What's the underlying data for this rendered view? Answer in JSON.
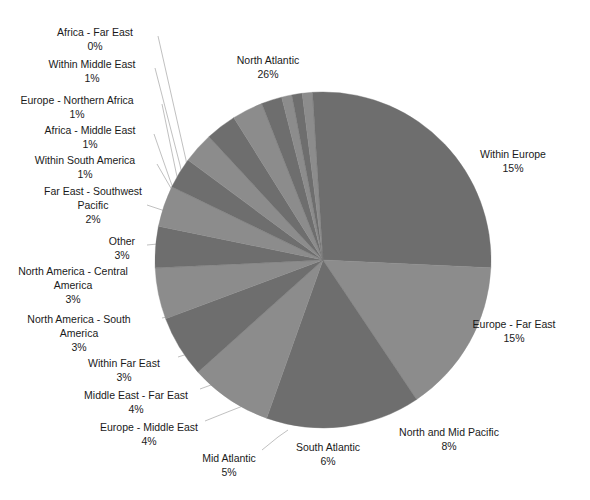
{
  "chart_data": {
    "type": "pie",
    "title": "",
    "subtitle": "",
    "xlabel": "",
    "ylabel": "",
    "grid": false,
    "legend_position": "none",
    "label_format": "name + percent",
    "start_angle_deg": 0,
    "direction": "clockwise",
    "center": {
      "x": 323,
      "y": 260
    },
    "radius": 168,
    "colors": {
      "dark_slice": "#6e6e6e",
      "light_slice": "#8c8c8c",
      "background": "#ffffff",
      "leader_line": "#b9b9b9",
      "label_text": "#1a1a1a"
    },
    "categories": [
      "North Atlantic",
      "Within Europe",
      "Europe - Far East",
      "North and Mid Pacific",
      "South Atlantic",
      "Mid Atlantic",
      "Europe - Middle East",
      "Middle East - Far East",
      "Within Far East",
      "North America - South America",
      "North America - Central America",
      "Other",
      "Far East - Southwest Pacific",
      "Within South America",
      "Africa - Middle East",
      "Europe - Northern Africa",
      "Within Middle East",
      "Africa - Far East"
    ],
    "values": [
      26,
      15,
      15,
      8,
      6,
      5,
      4,
      4,
      3,
      3,
      3,
      3,
      2,
      1,
      1,
      1,
      1,
      0
    ],
    "value_labels": [
      "26%",
      "15%",
      "15%",
      "8%",
      "6%",
      "5%",
      "4%",
      "4%",
      "3%",
      "3%",
      "3%",
      "3%",
      "2%",
      "1%",
      "1%",
      "1%",
      "1%",
      "0%"
    ]
  },
  "slices": [
    {
      "name": "North Atlantic",
      "pct": "26%",
      "value": 26,
      "fill": "#6e6e6e",
      "label_lines": [
        "North Atlantic"
      ],
      "lx": 268,
      "ly": 61,
      "leader": null
    },
    {
      "name": "Within Europe",
      "pct": "15%",
      "value": 15,
      "fill": "#8c8c8c",
      "label_lines": [
        "Within Europe"
      ],
      "lx": 513,
      "ly": 155,
      "leader": null
    },
    {
      "name": "Europe - Far East",
      "pct": "15%",
      "value": 15,
      "fill": "#6e6e6e",
      "label_lines": [
        "Europe - Far East"
      ],
      "lx": 514,
      "ly": 325,
      "leader": null
    },
    {
      "name": "North and Mid Pacific",
      "pct": "8%",
      "value": 8,
      "fill": "#8c8c8c",
      "label_lines": [
        "North and Mid Pacific"
      ],
      "lx": 449,
      "ly": 433,
      "leader": null
    },
    {
      "name": "South Atlantic",
      "pct": "6%",
      "value": 6,
      "fill": "#6e6e6e",
      "label_lines": [
        "South Atlantic"
      ],
      "lx": 328,
      "ly": 448,
      "leader": null
    },
    {
      "name": "Mid Atlantic",
      "pct": "5%",
      "value": 5,
      "fill": "#8c8c8c",
      "label_lines": [
        "Mid Atlantic"
      ],
      "lx": 229,
      "ly": 459,
      "leader": "M 262,450 L 278,437 L 288,430"
    },
    {
      "name": "Europe - Middle East",
      "pct": "4%",
      "value": 4,
      "fill": "#6e6e6e",
      "label_lines": [
        "Europe - Middle East"
      ],
      "lx": 149,
      "ly": 428,
      "leader": "M 205,421 L 230,411 L 248,404"
    },
    {
      "name": "Middle East - Far East",
      "pct": "4%",
      "value": 4,
      "fill": "#8c8c8c",
      "label_lines": [
        "Middle East - Far East"
      ],
      "lx": 136,
      "ly": 396,
      "leader": "M 200,389 L 222,381 L 238,374"
    },
    {
      "name": "Within Far East",
      "pct": "3%",
      "value": 3,
      "fill": "#6e6e6e",
      "label_lines": [
        "Within Far East"
      ],
      "lx": 124,
      "ly": 364,
      "leader": "M 178,357 L 200,350 L 216,344"
    },
    {
      "name": "North America - South America",
      "pct": "3%",
      "value": 3,
      "fill": "#8c8c8c",
      "label_lines": [
        "North America - South",
        "America"
      ],
      "lx": 79,
      "ly": 320,
      "leader": "M 162,318 L 186,313 L 200,309"
    },
    {
      "name": "North America - Central America",
      "pct": "3%",
      "value": 3,
      "fill": "#6e6e6e",
      "label_lines": [
        "North America - Central",
        "America"
      ],
      "lx": 73,
      "ly": 272,
      "leader": "M 158,276 L 178,274 L 190,273"
    },
    {
      "name": "Other",
      "pct": "3%",
      "value": 3,
      "fill": "#8c8c8c",
      "label_lines": [
        "Other"
      ],
      "lx": 122,
      "ly": 242,
      "leader": "M 147,245 L 168,243 L 182,242"
    },
    {
      "name": "Far East - Southwest Pacific",
      "pct": "2%",
      "value": 2,
      "fill": "#6e6e6e",
      "label_lines": [
        "Far East - Southwest",
        "Pacific"
      ],
      "lx": 93,
      "ly": 192,
      "leader": "M 147,205 L 168,212 L 180,216"
    },
    {
      "name": "Within South America",
      "pct": "1%",
      "value": 1,
      "fill": "#8c8c8c",
      "label_lines": [
        "Within South America"
      ],
      "lx": 85,
      "ly": 161,
      "leader": "M 157,164 L 172,190 L 180,205"
    },
    {
      "name": "Africa - Middle East",
      "pct": "1%",
      "value": 1,
      "fill": "#6e6e6e",
      "label_lines": [
        "Africa - Middle East"
      ],
      "lx": 90,
      "ly": 131,
      "leader": "M 154,134 L 170,180 L 178,201"
    },
    {
      "name": "Europe - Northern Africa",
      "pct": "1%",
      "value": 1,
      "fill": "#8c8c8c",
      "label_lines": [
        "Europe - Northern Africa"
      ],
      "lx": 77,
      "ly": 101,
      "leader": "M 162,104 L 176,172 L 182,197"
    },
    {
      "name": "Within Middle East",
      "pct": "1%",
      "value": 1,
      "fill": "#6e6e6e",
      "label_lines": [
        "Within Middle East"
      ],
      "lx": 92,
      "ly": 65,
      "leader": "M 155,68 L 180,165 L 186,193"
    },
    {
      "name": "Africa - Far East",
      "pct": "0%",
      "value": 0,
      "fill": "#8c8c8c",
      "label_lines": [
        "Africa - Far East"
      ],
      "lx": 95,
      "ly": 33,
      "leader": "M 158,36 L 186,160 L 190,190"
    }
  ]
}
